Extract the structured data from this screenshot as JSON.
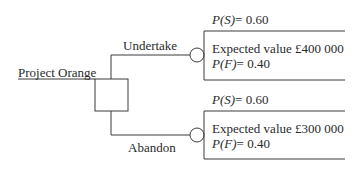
{
  "diagram": {
    "type": "decision-tree",
    "root": {
      "label": "Project Orange",
      "node_type": "decision"
    },
    "branches": [
      {
        "label": "Undertake",
        "chance_node": {
          "p_success_label": "P(S)",
          "p_success_value": "= 0.60",
          "expected_value": "Expected value £400 000",
          "p_failure_label": "P(F)",
          "p_failure_value": "= 0.40"
        }
      },
      {
        "label": "Abandon",
        "chance_node": {
          "p_success_label": "P(S)",
          "p_success_value": "= 0.60",
          "expected_value": "Expected value £300 000",
          "p_failure_label": "P(F)",
          "p_failure_value": "= 0.40"
        }
      }
    ],
    "colors": {
      "line": "#3a3a3a",
      "text": "#2a2a2a",
      "background": "#ffffff"
    }
  }
}
